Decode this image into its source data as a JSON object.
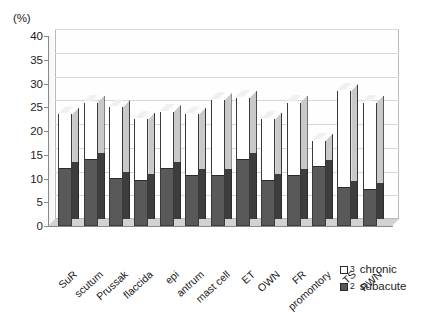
{
  "chart_data": {
    "type": "bar",
    "title": "",
    "subtitle": "",
    "xlabel": "",
    "ylabel": "(%)",
    "ylim": [
      0,
      40
    ],
    "yticks": [
      0,
      5,
      10,
      15,
      20,
      25,
      30,
      35,
      40
    ],
    "grid": true,
    "stacked": true,
    "legend_position": "bottom-right",
    "categories": [
      "SuR",
      "scutum",
      "Prussak",
      "flaccida",
      "epi",
      "antrum",
      "mast cell",
      "ET",
      "OWN",
      "FR",
      "promontory",
      "TS",
      "RWN"
    ],
    "series": [
      {
        "name": "subacute",
        "legend_number": "2",
        "color": "#595959",
        "values": [
          12,
          14,
          10,
          9.5,
          12,
          10.5,
          10.5,
          14,
          9.5,
          10.5,
          12.5,
          8,
          7.5
        ]
      },
      {
        "name": "chronic",
        "legend_number": "3",
        "color": "#ffffff",
        "values": [
          11.5,
          12,
          15,
          13,
          12,
          13,
          16,
          13,
          13,
          15.5,
          5.5,
          20.5,
          18.5
        ]
      }
    ],
    "totals": [
      23.5,
      26,
      25,
      22.5,
      24,
      23.5,
      26.5,
      27,
      22.5,
      26,
      18,
      28.5,
      26
    ]
  },
  "axis": {
    "unit_label": "(%)",
    "tick_labels": [
      "40",
      "35",
      "30",
      "25",
      "20",
      "15",
      "10",
      "5",
      "0"
    ]
  },
  "legend": {
    "items": [
      {
        "number": "3",
        "label": "chronic",
        "swatch": "white"
      },
      {
        "number": "2",
        "label": "subacute",
        "swatch": "dark"
      }
    ]
  }
}
